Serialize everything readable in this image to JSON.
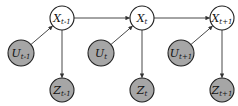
{
  "diagram": {
    "type": "dynamic-bayesian-network",
    "colors": {
      "hidden_fill": "#ffffff",
      "observed_fill": "#a6a6a6",
      "stroke": "#222222",
      "edge": "#333333"
    },
    "nodes": [
      {
        "id": "x_prev",
        "base": "X",
        "sub": "t-1",
        "kind": "hidden",
        "cx": 62,
        "cy": 18,
        "r": 12
      },
      {
        "id": "x_curr",
        "base": "X",
        "sub": "t",
        "kind": "hidden",
        "cx": 142,
        "cy": 18,
        "r": 12
      },
      {
        "id": "x_next",
        "base": "X",
        "sub": "t+1",
        "kind": "hidden",
        "cx": 222,
        "cy": 18,
        "r": 12
      },
      {
        "id": "u_prev",
        "base": "U",
        "sub": "t-1",
        "kind": "observed",
        "cx": 21,
        "cy": 53,
        "r": 13
      },
      {
        "id": "u_curr",
        "base": "U",
        "sub": "t",
        "kind": "observed",
        "cx": 101,
        "cy": 53,
        "r": 13
      },
      {
        "id": "u_next",
        "base": "U",
        "sub": "t+1",
        "kind": "observed",
        "cx": 181,
        "cy": 53,
        "r": 13
      },
      {
        "id": "z_prev",
        "base": "Z",
        "sub": "t-1",
        "kind": "observed",
        "cx": 62,
        "cy": 90,
        "r": 12
      },
      {
        "id": "z_curr",
        "base": "Z",
        "sub": "t",
        "kind": "observed",
        "cx": 142,
        "cy": 90,
        "r": 12
      },
      {
        "id": "z_next",
        "base": "Z",
        "sub": "t+1",
        "kind": "observed",
        "cx": 222,
        "cy": 90,
        "r": 12
      }
    ],
    "edges": [
      {
        "from": "x_prev",
        "to": "x_curr"
      },
      {
        "from": "x_curr",
        "to": "x_next"
      },
      {
        "from": "u_prev",
        "to": "x_prev"
      },
      {
        "from": "u_curr",
        "to": "x_curr"
      },
      {
        "from": "u_next",
        "to": "x_next"
      },
      {
        "from": "x_prev",
        "to": "z_prev"
      },
      {
        "from": "x_curr",
        "to": "z_curr"
      },
      {
        "from": "x_next",
        "to": "z_next"
      }
    ]
  }
}
